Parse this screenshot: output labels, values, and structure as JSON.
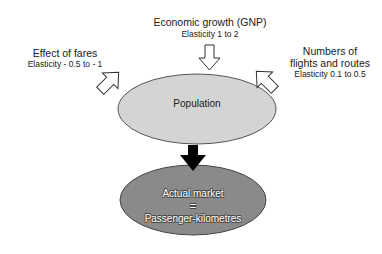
{
  "diagram": {
    "nodes": {
      "population": {
        "label": "Population",
        "fill": "#d4d4d4",
        "stroke": "#555555"
      },
      "actual_market": {
        "line1": "Actual market",
        "line2": "=",
        "line3": "Passenger-kilometres",
        "fill": "#8a8a8a",
        "stroke": "#444444"
      }
    },
    "factors": {
      "economic_growth": {
        "title": "Economic growth (GNP)",
        "elasticity": "Elasticity 1 to 2"
      },
      "fares": {
        "title": "Effect of fares",
        "elasticity": "Elasticity - 0.5 to - 1"
      },
      "flights": {
        "title_line1": "Numbers of",
        "title_line2": "flights and routes",
        "elasticity": "Elasticity 0.1 to 0.5"
      }
    },
    "arrows": {
      "input_style": "hollow",
      "output_style": "solid",
      "output_color": "#000000"
    }
  }
}
